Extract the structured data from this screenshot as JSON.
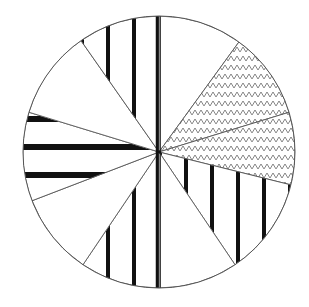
{
  "chart_data": {
    "type": "pie",
    "title": "",
    "legend": [],
    "center": [
      159,
      152
    ],
    "radius": 136,
    "start_angle_deg": 0,
    "direction": "clockwise",
    "slices": [
      {
        "label": "",
        "start": 0,
        "end": 36,
        "pattern": "none",
        "value_pct": 10.0
      },
      {
        "label": "",
        "start": 36,
        "end": 73,
        "pattern": "zigzag",
        "value_pct": 10.3
      },
      {
        "label": "",
        "start": 73,
        "end": 104,
        "pattern": "zigzag",
        "value_pct": 8.6
      },
      {
        "label": "",
        "start": 104,
        "end": 146,
        "pattern": "vertical-stripes",
        "value_pct": 11.7
      },
      {
        "label": "",
        "start": 146,
        "end": 180,
        "pattern": "none",
        "value_pct": 9.4
      },
      {
        "label": "",
        "start": 180,
        "end": 214,
        "pattern": "vertical-stripes",
        "value_pct": 9.4
      },
      {
        "label": "",
        "start": 214,
        "end": 249,
        "pattern": "none",
        "value_pct": 9.7
      },
      {
        "label": "",
        "start": 249,
        "end": 287,
        "pattern": "horizontal-stripes",
        "value_pct": 10.6
      },
      {
        "label": "",
        "start": 287,
        "end": 325,
        "pattern": "none",
        "value_pct": 10.6
      },
      {
        "label": "",
        "start": 325,
        "end": 360,
        "pattern": "vertical-stripes",
        "value_pct": 9.7
      }
    ],
    "colors": {
      "stroke": "#555555",
      "stripe": "#111111",
      "zigzag": "#777777",
      "fill": "#ffffff"
    }
  }
}
